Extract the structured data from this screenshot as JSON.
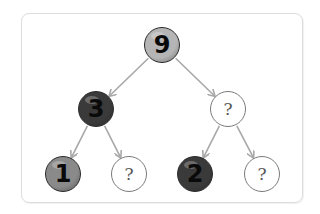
{
  "diagram": {
    "type": "binary-tree",
    "edge_color": "#a8a8a8",
    "frame_color": "#dcdcdc",
    "nodes": [
      {
        "id": "root",
        "label": "9",
        "fill": "#b5b5b5",
        "x": 162,
        "y": 45,
        "kind": "filled"
      },
      {
        "id": "left",
        "label": "3",
        "fill": "#3a3a3a",
        "x": 96,
        "y": 109,
        "kind": "filled"
      },
      {
        "id": "right",
        "label": "?",
        "fill": "#ffffff",
        "x": 228,
        "y": 109,
        "kind": "empty"
      },
      {
        "id": "left-left",
        "label": "1",
        "fill": "#8a8a8a",
        "x": 63,
        "y": 174,
        "kind": "filled"
      },
      {
        "id": "left-right",
        "label": "?",
        "fill": "#ffffff",
        "x": 129,
        "y": 174,
        "kind": "empty"
      },
      {
        "id": "right-left",
        "label": "2",
        "fill": "#3a3a3a",
        "x": 195,
        "y": 174,
        "kind": "filled"
      },
      {
        "id": "right-right",
        "label": "?",
        "fill": "#ffffff",
        "x": 262,
        "y": 174,
        "kind": "empty"
      }
    ],
    "edges": [
      {
        "from": "root",
        "to": "left"
      },
      {
        "from": "root",
        "to": "right"
      },
      {
        "from": "left",
        "to": "left-left"
      },
      {
        "from": "left",
        "to": "left-right"
      },
      {
        "from": "right",
        "to": "right-left"
      },
      {
        "from": "right",
        "to": "right-right"
      }
    ]
  }
}
